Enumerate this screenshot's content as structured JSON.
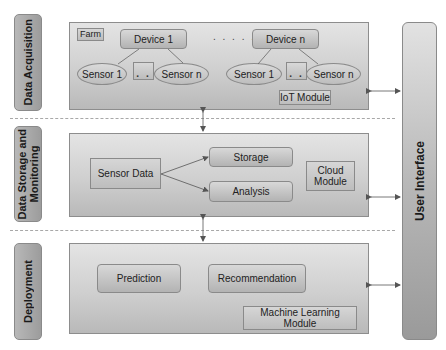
{
  "layers": [
    {
      "label": "Data Acquisition",
      "farm_label": "Farm",
      "devices": [
        {
          "label": "Device 1",
          "sensors": [
            "Sensor 1",
            "Sensor n"
          ],
          "ellipsis": ". ."
        },
        {
          "label": "Device n",
          "sensors": [
            "Sensor 1",
            "Sensor n"
          ],
          "ellipsis": ". ."
        }
      ],
      "device_ellipsis": ". . . . .",
      "module_label": "IoT Module"
    },
    {
      "label": "Data Storage and\nMonitoring",
      "source_label": "Sensor Data",
      "targets": [
        "Storage",
        "Analysis"
      ],
      "module_label": "Cloud\nModule"
    },
    {
      "label": "Deployment",
      "items": [
        "Prediction",
        "Recommendation"
      ],
      "module_label": "Machine Learning\nModule"
    }
  ],
  "user_interface": {
    "label": "User Interface"
  },
  "colors": {
    "panel_border": "#8d8d8d",
    "arrow": "#555555",
    "separator": "#a8a8a8"
  }
}
